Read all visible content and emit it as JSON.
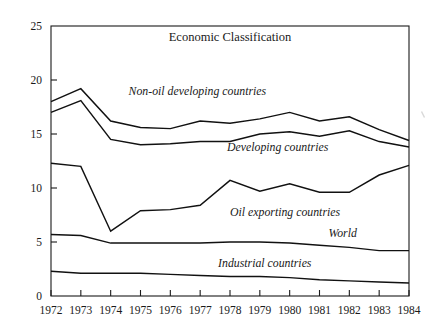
{
  "header_bleed": "  ",
  "chart_data": {
    "type": "line",
    "title": "Economic Classification",
    "xlabel": "",
    "ylabel": "",
    "x": [
      1972,
      1973,
      1974,
      1975,
      1976,
      1977,
      1978,
      1979,
      1980,
      1981,
      1982,
      1983,
      1984
    ],
    "xtick_labels": [
      "1972",
      "1973",
      "1974",
      "1975",
      "1976",
      "1977",
      "1978",
      "1979",
      "1980",
      "1981",
      "1982",
      "1983",
      "1984"
    ],
    "ytick_labels": [
      "0",
      "5",
      "10",
      "15",
      "20",
      "25"
    ],
    "yticks": [
      0,
      5,
      10,
      15,
      20,
      25
    ],
    "ylim": [
      0,
      25
    ],
    "xlim": [
      1972,
      1984
    ],
    "grid": false,
    "legend": "inline-annotations",
    "line_color": "#111111",
    "series": [
      {
        "name": "Non-oil developing countries",
        "label_x": 1974.6,
        "label_y": 18.6,
        "values": [
          18.0,
          19.2,
          16.2,
          15.6,
          15.5,
          16.2,
          16.0,
          16.4,
          17.0,
          16.2,
          16.6,
          15.4,
          14.4
        ]
      },
      {
        "name": "Developing countries",
        "label_x": 1977.9,
        "label_y": 13.4,
        "values": [
          17.0,
          18.1,
          14.5,
          14.0,
          14.1,
          14.3,
          14.3,
          15.0,
          15.2,
          14.8,
          15.3,
          14.3,
          13.8
        ]
      },
      {
        "name": "Oil exporting countries",
        "label_x": 1978.0,
        "label_y": 7.4,
        "values": [
          12.3,
          12.0,
          6.0,
          7.9,
          8.0,
          8.4,
          10.7,
          9.7,
          10.4,
          9.6,
          9.6,
          11.2,
          12.1
        ]
      },
      {
        "name": "World",
        "label_x": 1981.3,
        "label_y": 5.5,
        "values": [
          5.7,
          5.6,
          4.9,
          4.9,
          4.9,
          4.9,
          5.0,
          5.0,
          4.9,
          4.7,
          4.5,
          4.2,
          4.2
        ]
      },
      {
        "name": "Industrial countries",
        "label_x": 1977.6,
        "label_y": 2.7,
        "values": [
          2.3,
          2.1,
          2.1,
          2.1,
          2.0,
          1.9,
          1.8,
          1.8,
          1.7,
          1.5,
          1.4,
          1.3,
          1.2
        ]
      }
    ]
  }
}
